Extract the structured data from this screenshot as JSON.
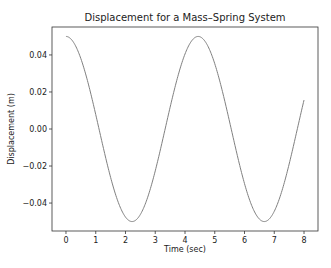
{
  "chart_data": {
    "type": "line",
    "title": "Displacement for a Mass–Spring System",
    "xlabel": "Time (sec)",
    "ylabel": "Displacement (m)",
    "xlim": [
      -0.47,
      8.47
    ],
    "ylim": [
      -0.0551,
      0.0551
    ],
    "xticks": [
      0,
      1,
      2,
      3,
      4,
      5,
      6,
      7,
      8
    ],
    "yticks": [
      -0.04,
      -0.02,
      0.0,
      0.02,
      0.04
    ],
    "ytick_labels": [
      "−0.04",
      "−0.02",
      "0.00",
      "0.02",
      "0.04"
    ],
    "grid": false,
    "legend": null,
    "series": [
      {
        "name": "displacement",
        "color": "#808080",
        "function": "0.05*cos(1.4142*t)",
        "x": [
          0,
          0.25,
          0.5,
          0.75,
          1,
          1.25,
          1.5,
          1.75,
          2,
          2.25,
          2.5,
          2.75,
          3,
          3.25,
          3.5,
          3.75,
          4,
          4.25,
          4.5,
          4.75,
          5,
          5.25,
          5.5,
          5.75,
          6,
          6.25,
          6.5,
          6.75,
          7,
          7.25,
          7.5,
          7.75,
          8
        ],
        "values": [
          0.05,
          0.047,
          0.038,
          0.0245,
          0.0078,
          -0.0092,
          -0.0251,
          -0.0385,
          -0.0475,
          -0.05,
          -0.0462,
          -0.0366,
          -0.0234,
          -0.0064,
          0.0106,
          0.0262,
          0.0392,
          0.0478,
          0.0499,
          0.0455,
          0.0355,
          0.0218,
          0.005,
          -0.012,
          -0.0273,
          -0.04,
          -0.0481,
          -0.0497,
          -0.0447,
          -0.0344,
          -0.0203,
          -0.0036,
          0.0155
        ]
      }
    ]
  }
}
